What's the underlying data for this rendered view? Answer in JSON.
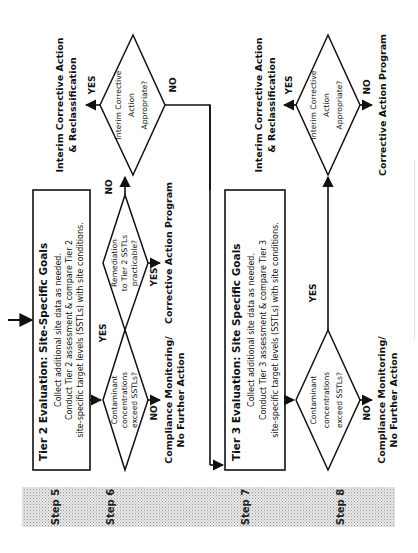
{
  "figure": {
    "orientation": "rotated 90 degrees counter-clockwise",
    "steps": [
      {
        "label": "Step 5"
      },
      {
        "label": "Step 6"
      },
      {
        "label": "Step 7"
      },
      {
        "label": "Step 8"
      }
    ],
    "tier2_box": {
      "title": "Tier 2 Evaluation: Site-Specific Goals",
      "lines": [
        "Collect additional site data as needed.",
        "Conduct Tier 2 assessment & compare Tier 2",
        "site-specific target levels (SSTLs) with site conditions."
      ]
    },
    "tier3_box": {
      "title": "Tier 3 Evaluation: Site Specific Goals",
      "lines": [
        "Collect additional site data as needed.",
        "Conduct Tier 3 assessment & compare Tier 3",
        "site-specific target levels (SSTLs) with site conditions."
      ]
    },
    "step6": {
      "decision_contaminant": {
        "lines": [
          "Contaminant",
          "concentrations",
          "exceed SSTLs?"
        ],
        "yes": "YES",
        "no": "NO"
      },
      "outcome_no": [
        "Compliance Monitoring/",
        "No Further Action"
      ],
      "decision_remediation": {
        "lines": [
          "Remediation",
          "to Tier 2 SSTLs",
          "practicable?"
        ],
        "yes": "YES",
        "no": "NO"
      },
      "outcome_remediation_yes": "Corrective Action Program",
      "decision_interim": {
        "lines": [
          "Interim Corrective",
          "Action",
          "Appropriate?"
        ],
        "yes": "YES",
        "no": "NO"
      },
      "outcome_interim_yes": [
        "Interim Corrective Action",
        "& Reclassification"
      ]
    },
    "step8": {
      "decision_contaminant": {
        "lines": [
          "Contaminant",
          "concentrations",
          "exceed SSTLs?"
        ],
        "yes": "YES",
        "no": "NO"
      },
      "outcome_no": [
        "Compliance Monitoring/",
        "No Further Action"
      ],
      "decision_interim": {
        "lines": [
          "Interim Corrective",
          "Action",
          "Appropriate?"
        ],
        "yes": "YES",
        "no": "NO"
      },
      "outcome_interim_yes": [
        "Interim Corrective Action",
        "& Reclassification"
      ],
      "outcome_interim_no": "Corrective Action Program"
    },
    "colors": {
      "line": "#111111",
      "step_band": "#d6d6d6",
      "background": "#ffffff"
    }
  }
}
